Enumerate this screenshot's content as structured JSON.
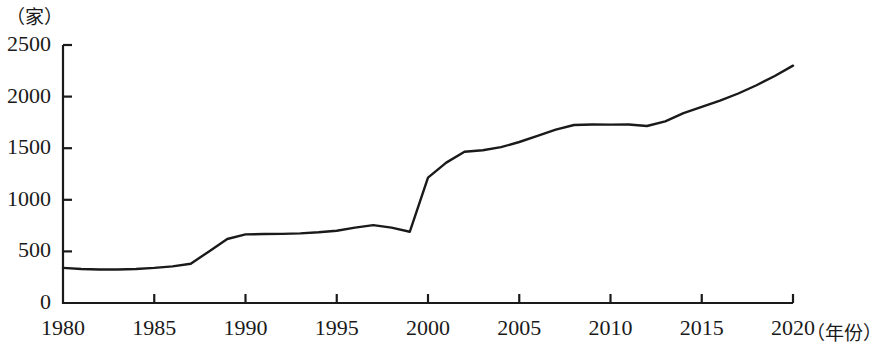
{
  "chart_data": {
    "type": "line",
    "title": "",
    "subtitle": "",
    "xlabel": "（年份）",
    "ylabel": "（家）",
    "xlim": [
      1980,
      2020
    ],
    "ylim": [
      0,
      2500
    ],
    "grid": false,
    "legend": null,
    "x_ticks": [
      1980,
      1985,
      1990,
      1995,
      2000,
      2005,
      2010,
      2015,
      2020
    ],
    "y_ticks": [
      0,
      500,
      1000,
      1500,
      2000,
      2500
    ],
    "series": [
      {
        "name": "数量",
        "x": [
          1980,
          1981,
          1982,
          1983,
          1984,
          1985,
          1986,
          1987,
          1988,
          1989,
          1990,
          1991,
          1992,
          1993,
          1994,
          1995,
          1996,
          1997,
          1998,
          1999,
          2000,
          2001,
          2002,
          2003,
          2004,
          2005,
          2006,
          2007,
          2008,
          2009,
          2010,
          2011,
          2012,
          2013,
          2014,
          2015,
          2016,
          2017,
          2018,
          2019,
          2020
        ],
        "values": [
          340,
          330,
          325,
          325,
          330,
          340,
          355,
          380,
          500,
          620,
          665,
          668,
          670,
          675,
          685,
          700,
          730,
          755,
          730,
          690,
          1215,
          1360,
          1465,
          1480,
          1510,
          1560,
          1620,
          1680,
          1725,
          1730,
          1728,
          1730,
          1715,
          1760,
          1840,
          1900,
          1960,
          2030,
          2110,
          2200,
          2300
        ]
      }
    ],
    "line_color": "#1a1a1a",
    "line_width": 2.4,
    "axis_color": "#1a1a1a"
  },
  "axes": {
    "y_unit": "（家）",
    "x_unit": "（年份）",
    "y_tick_labels": [
      "2500",
      "2000",
      "1500",
      "1000",
      "500",
      "0"
    ],
    "x_tick_labels": [
      "1980",
      "1985",
      "1990",
      "1995",
      "2000",
      "2005",
      "2010",
      "2015",
      "2020"
    ]
  }
}
